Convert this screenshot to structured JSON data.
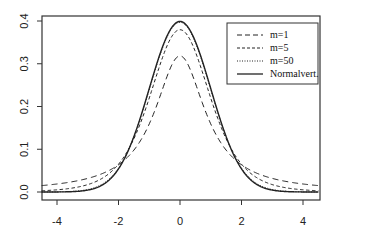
{
  "chart_data": {
    "type": "line",
    "title": "",
    "xlabel": "",
    "ylabel": "",
    "xlim": [
      -4.5,
      4.5
    ],
    "ylim": [
      0.0,
      0.4
    ],
    "x_ticks": [
      -4,
      -2,
      0,
      2,
      4
    ],
    "x_tick_labels": [
      "-4",
      "-2",
      "0",
      "2",
      "4"
    ],
    "y_ticks": [
      0.0,
      0.1,
      0.2,
      0.3,
      0.4
    ],
    "y_tick_labels": [
      "0.0",
      "0.1",
      "0.2",
      "0.3",
      "0.4"
    ],
    "grid": false,
    "legend_position": "top-right",
    "x": [
      -4.5,
      -4.0,
      -3.5,
      -3.0,
      -2.5,
      -2.0,
      -1.5,
      -1.0,
      -0.5,
      0.0,
      0.5,
      1.0,
      1.5,
      2.0,
      2.5,
      3.0,
      3.5,
      4.0,
      4.5
    ],
    "series": [
      {
        "name": "m=1",
        "style": "long-dash",
        "values": [
          0.015,
          0.019,
          0.024,
          0.032,
          0.044,
          0.064,
          0.098,
          0.159,
          0.255,
          0.318,
          0.255,
          0.159,
          0.098,
          0.064,
          0.044,
          0.032,
          0.024,
          0.019,
          0.015
        ]
      },
      {
        "name": "m=5",
        "style": "short-dash",
        "values": [
          0.004,
          0.005,
          0.009,
          0.017,
          0.036,
          0.065,
          0.124,
          0.22,
          0.328,
          0.38,
          0.328,
          0.22,
          0.124,
          0.065,
          0.036,
          0.017,
          0.009,
          0.005,
          0.004
        ]
      },
      {
        "name": "m=50",
        "style": "dotted",
        "values": [
          0.0,
          0.0,
          0.001,
          0.005,
          0.018,
          0.055,
          0.128,
          0.24,
          0.35,
          0.397,
          0.35,
          0.24,
          0.128,
          0.055,
          0.018,
          0.005,
          0.001,
          0.0,
          0.0
        ]
      },
      {
        "name": "Normalvert.",
        "style": "solid",
        "values": [
          0.0,
          0.0,
          0.001,
          0.004,
          0.018,
          0.054,
          0.13,
          0.242,
          0.352,
          0.399,
          0.352,
          0.242,
          0.13,
          0.054,
          0.018,
          0.004,
          0.001,
          0.0,
          0.0
        ]
      }
    ]
  },
  "legend": {
    "items": [
      {
        "label": "m=1"
      },
      {
        "label": "m=5"
      },
      {
        "label": "m=50"
      },
      {
        "label": "Normalvert."
      }
    ]
  }
}
